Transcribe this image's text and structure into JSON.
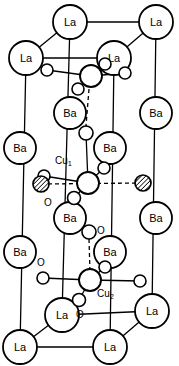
{
  "figure": {
    "kind": "crystal-structure-diagram",
    "background_color": "#ffffff",
    "line_color": "#000000",
    "atom_fill": "#ffffff"
  },
  "labels": {
    "la": "La",
    "ba": "Ba",
    "cu1": "Cu",
    "cu1_sub": "1",
    "cu2": "Cu",
    "cu2_sub": "2",
    "oxygen": "O"
  },
  "atoms": {
    "la": [
      {
        "name": "la-top-back-left",
        "x": 70,
        "y": 22,
        "r": 17
      },
      {
        "name": "la-top-back-right",
        "x": 156,
        "y": 22,
        "r": 17
      },
      {
        "name": "la-top-front-left",
        "x": 26,
        "y": 58,
        "r": 17
      },
      {
        "name": "la-top-front-right",
        "x": 114,
        "y": 58,
        "r": 17
      },
      {
        "name": "la-bot-back-left",
        "x": 62,
        "y": 315,
        "r": 17
      },
      {
        "name": "la-bot-back-right",
        "x": 152,
        "y": 311,
        "r": 17
      },
      {
        "name": "la-bot-front-left",
        "x": 20,
        "y": 347,
        "r": 17
      },
      {
        "name": "la-bot-front-right",
        "x": 110,
        "y": 347,
        "r": 17
      }
    ],
    "ba": [
      {
        "name": "ba-upper-back-mid",
        "x": 70,
        "y": 113,
        "r": 16
      },
      {
        "name": "ba-upper-back-right",
        "x": 156,
        "y": 113,
        "r": 16
      },
      {
        "name": "ba-upper-front-left",
        "x": 20,
        "y": 148,
        "r": 16
      },
      {
        "name": "ba-upper-front-mid",
        "x": 110,
        "y": 148,
        "r": 16
      },
      {
        "name": "ba-lower-back-mid",
        "x": 70,
        "y": 218,
        "r": 16
      },
      {
        "name": "ba-lower-back-right",
        "x": 156,
        "y": 218,
        "r": 16
      },
      {
        "name": "ba-lower-front-left",
        "x": 20,
        "y": 252,
        "r": 16
      },
      {
        "name": "ba-lower-front-mid",
        "x": 110,
        "y": 252,
        "r": 16
      }
    ],
    "cu": [
      {
        "name": "cu-upper-site",
        "x": 91,
        "y": 76,
        "r": 11
      },
      {
        "name": "cu1-site",
        "x": 88,
        "y": 183,
        "r": 11
      },
      {
        "name": "cu2-site",
        "x": 90,
        "y": 280,
        "r": 11
      }
    ],
    "oxygen": [
      {
        "name": "o-upper-left",
        "x": 47,
        "y": 70,
        "r": 6
      },
      {
        "name": "o-upper-right",
        "x": 125,
        "y": 73,
        "r": 6
      },
      {
        "name": "o-upper-back",
        "x": 105,
        "y": 64,
        "r": 6
      },
      {
        "name": "o-upper-front",
        "x": 78,
        "y": 89,
        "r": 6
      },
      {
        "name": "o-apical-upper",
        "x": 86,
        "y": 133,
        "r": 7
      },
      {
        "name": "o-cu1-back",
        "x": 104,
        "y": 168,
        "r": 6
      },
      {
        "name": "o-cu1-front",
        "x": 74,
        "y": 198,
        "r": 6
      },
      {
        "name": "o-cu1-left",
        "x": 44,
        "y": 176,
        "r": 6
      },
      {
        "name": "o-apical-lower",
        "x": 89,
        "y": 232,
        "r": 7
      },
      {
        "name": "o-cu2-back",
        "x": 105,
        "y": 267,
        "r": 6
      },
      {
        "name": "o-cu2-left",
        "x": 43,
        "y": 278,
        "r": 6
      },
      {
        "name": "o-cu2-right",
        "x": 140,
        "y": 281,
        "r": 6
      },
      {
        "name": "o-cu2-front",
        "x": 79,
        "y": 300,
        "r": 6
      }
    ],
    "dopant": [
      {
        "name": "dopant-left",
        "x": 41,
        "y": 184,
        "r": 8
      },
      {
        "name": "dopant-right",
        "x": 143,
        "y": 183,
        "r": 8
      }
    ]
  },
  "text_annotations": [
    {
      "name": "cu1-text",
      "text": "Cu",
      "sub": "1",
      "x": 55,
      "y": 160
    },
    {
      "name": "cu2-text",
      "text": "Cu",
      "sub": "2",
      "x": 97,
      "y": 293
    },
    {
      "name": "o-label-mid",
      "text": "O",
      "x": 48,
      "y": 202
    },
    {
      "name": "o-label-apical",
      "text": "O",
      "x": 101,
      "y": 230
    },
    {
      "name": "o-label-lower",
      "text": "O",
      "x": 41,
      "y": 262
    },
    {
      "name": "o-label-bottom",
      "text": "O",
      "x": 80,
      "y": 314
    }
  ]
}
